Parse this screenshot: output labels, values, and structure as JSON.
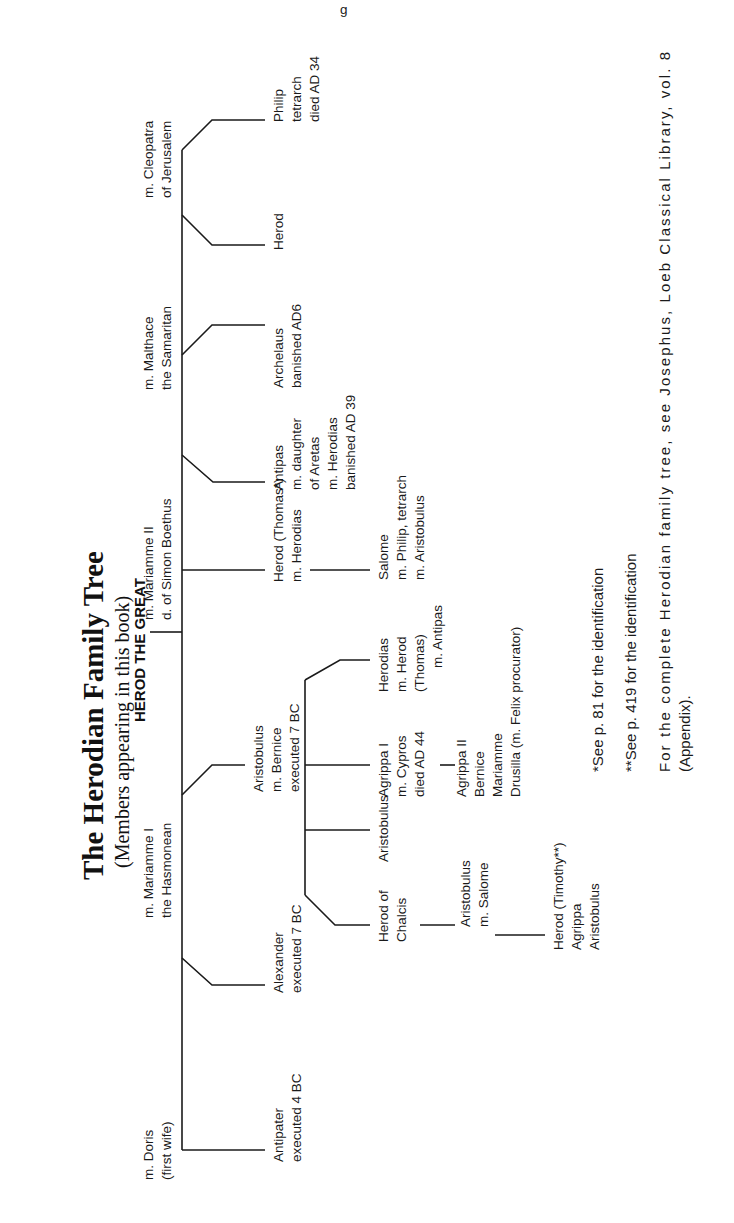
{
  "page": {
    "running_head_fragment": "g",
    "orientation": "rotated-90-ccw"
  },
  "header": {
    "title": "The Herodian Family Tree",
    "subtitle": "(Members appearing in this book)"
  },
  "root": {
    "name": "HEROD THE GREAT"
  },
  "wives": [
    {
      "line1": "m. Doris",
      "line2": "(first wife)"
    },
    {
      "line1": "m. Mariamme I",
      "line2": "the Hasmonean"
    },
    {
      "line1": "m. Mariamme II",
      "line2": "d. of Simon Boethus"
    },
    {
      "line1": "m. Malthace",
      "line2": "the Samaritan"
    },
    {
      "line1": "m. Cleopatra",
      "line2": "of Jerusalem"
    }
  ],
  "children": {
    "antipater": {
      "lines": [
        "Antipater",
        "executed 4 BC"
      ]
    },
    "alexander": {
      "lines": [
        "Alexander",
        "executed 7 BC"
      ]
    },
    "aristobulus": {
      "lines": [
        "Aristobulus",
        "m. Bernice",
        "executed 7 BC"
      ]
    },
    "herod_thomas": {
      "lines": [
        "Herod (Thomas*)",
        "m. Herodias"
      ]
    },
    "antipas": {
      "lines": [
        "Antipas",
        "m. daughter",
        "of Aretas",
        "m. Herodias",
        "banished AD 39"
      ]
    },
    "archelaus": {
      "lines": [
        "Archelaus",
        "banished AD6"
      ]
    },
    "herod": {
      "lines": [
        "Herod"
      ]
    },
    "philip": {
      "lines": [
        "Philip",
        "tetrarch",
        "died AD 34"
      ]
    }
  },
  "grandchildren": {
    "herod_of_chalcis": {
      "lines": [
        "Herod of",
        "Chalcis"
      ]
    },
    "aristobulus": {
      "lines": [
        "Aristobulus"
      ]
    },
    "agrippa_i": {
      "lines": [
        "Agrippa I",
        "m. Cypros",
        "died AD 44"
      ]
    },
    "herodias": {
      "lines": [
        "Herodias",
        "m. Herod",
        "(Thomas)",
        "m. Antipas"
      ]
    },
    "salome": {
      "lines": [
        "Salome",
        "m. Philip, tetrarch",
        "m. Aristobulus"
      ]
    }
  },
  "great_grandchildren": {
    "aristobulus_salome": {
      "lines": [
        "Aristobulus",
        "m. Salome"
      ]
    },
    "agrippa_ii_group": {
      "lines": [
        "Agrippa II",
        "Bernice",
        "Mariamme",
        "Drusilla (m. Felix procurator)"
      ]
    },
    "herod_timothy_group": {
      "lines": [
        "Herod (Timothy**)",
        "Agrippa",
        "Aristobulus"
      ]
    }
  },
  "footnotes": {
    "note1": "*See p. 81 for the identification",
    "note2": "**See p. 419 for the identification",
    "note3_line1": "For the complete Herodian family tree, see Josephus, Loeb Classical Library, vol. 8",
    "note3_line2": "(Appendix)."
  }
}
